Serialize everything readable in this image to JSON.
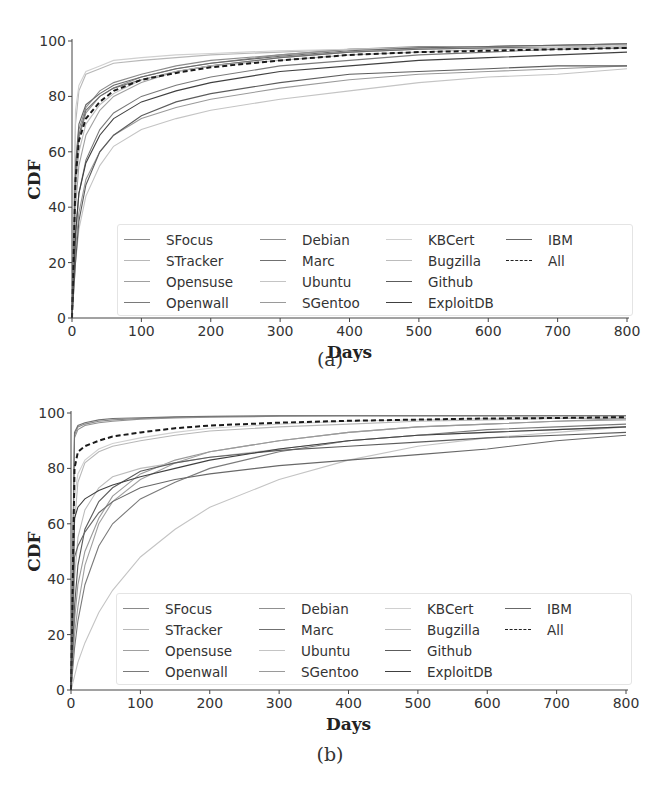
{
  "figure": {
    "panels": [
      {
        "id": "a",
        "caption": "(a)",
        "ylabel": "CDF",
        "xlabel": "Days"
      },
      {
        "id": "b",
        "caption": "(b)",
        "ylabel": "CDF",
        "xlabel": "Days"
      }
    ],
    "xticks": [
      "0",
      "100",
      "200",
      "300",
      "400",
      "500",
      "600",
      "700",
      "800"
    ],
    "yticks": [
      "0",
      "20",
      "40",
      "60",
      "80",
      "100"
    ],
    "legend": [
      {
        "label": "SFocus",
        "color": "#8a8a8a",
        "style": "solid"
      },
      {
        "label": "STracker",
        "color": "#b8b8b8",
        "style": "solid"
      },
      {
        "label": "Opensuse",
        "color": "#a0a0a0",
        "style": "solid"
      },
      {
        "label": "Openwall",
        "color": "#7a7a7a",
        "style": "solid"
      },
      {
        "label": "Debian",
        "color": "#909090",
        "style": "solid"
      },
      {
        "label": "Marc",
        "color": "#707070",
        "style": "solid"
      },
      {
        "label": "Ubuntu",
        "color": "#c4c4c4",
        "style": "solid"
      },
      {
        "label": "SGentoo",
        "color": "#9a9a9a",
        "style": "solid"
      },
      {
        "label": "KBCert",
        "color": "#d0d0d0",
        "style": "solid"
      },
      {
        "label": "Bugzilla",
        "color": "#bcbcbc",
        "style": "solid"
      },
      {
        "label": "Github",
        "color": "#5c5c5c",
        "style": "solid"
      },
      {
        "label": "ExploitDB",
        "color": "#404040",
        "style": "solid"
      },
      {
        "label": "IBM",
        "color": "#686868",
        "style": "solid"
      },
      {
        "label": "All",
        "color": "#1a1a1a",
        "style": "dashed"
      }
    ]
  },
  "chart_data": [
    {
      "type": "line",
      "title": "(a)",
      "xlabel": "Days",
      "ylabel": "CDF",
      "xlim": [
        0,
        800
      ],
      "ylim": [
        0,
        100
      ],
      "grid": false,
      "legend_position": "lower right, 4 columns",
      "x": [
        0,
        5,
        10,
        20,
        40,
        60,
        100,
        150,
        200,
        300,
        400,
        500,
        600,
        700,
        800
      ],
      "series": [
        {
          "name": "SFocus",
          "values": [
            0,
            55,
            68,
            76,
            82,
            85,
            88,
            91,
            93,
            95,
            97,
            98,
            98,
            98.5,
            99
          ]
        },
        {
          "name": "STracker",
          "values": [
            0,
            70,
            82,
            88,
            90,
            92,
            93,
            94,
            95,
            96,
            97,
            97.5,
            98,
            98,
            98.5
          ]
        },
        {
          "name": "Opensuse",
          "values": [
            0,
            40,
            55,
            66,
            75,
            80,
            85,
            89,
            91,
            94,
            96,
            97,
            97.5,
            98,
            98.5
          ]
        },
        {
          "name": "Openwall",
          "values": [
            0,
            30,
            45,
            57,
            68,
            74,
            80,
            84,
            87,
            91,
            93,
            95,
            96,
            97,
            97.5
          ]
        },
        {
          "name": "Debian",
          "values": [
            0,
            50,
            65,
            74,
            80,
            83,
            87,
            90,
            92,
            95,
            97,
            97.5,
            98,
            98.5,
            99
          ]
        },
        {
          "name": "Marc",
          "values": [
            0,
            50,
            66,
            75,
            80,
            83,
            86,
            89,
            91,
            94,
            96,
            97,
            97.5,
            98,
            98.5
          ]
        },
        {
          "name": "Ubuntu",
          "values": [
            0,
            20,
            32,
            44,
            55,
            62,
            68,
            72,
            75,
            79,
            82,
            85,
            87,
            88,
            90
          ]
        },
        {
          "name": "SGentoo",
          "values": [
            0,
            25,
            38,
            50,
            60,
            66,
            72,
            76,
            79,
            83,
            86,
            88,
            89,
            90,
            91
          ]
        },
        {
          "name": "KBCert",
          "values": [
            0,
            75,
            84,
            89,
            91,
            93,
            94,
            95,
            95.5,
            96.5,
            97,
            97.5,
            98,
            98,
            98.5
          ]
        },
        {
          "name": "Bugzilla",
          "values": [
            0,
            45,
            60,
            70,
            77,
            81,
            86,
            89,
            91,
            93,
            95,
            96,
            97,
            97.5,
            98
          ]
        },
        {
          "name": "Github",
          "values": [
            0,
            20,
            35,
            48,
            60,
            66,
            73,
            78,
            81,
            85,
            88,
            89,
            90,
            91,
            91
          ]
        },
        {
          "name": "ExploitDB",
          "values": [
            0,
            30,
            45,
            56,
            66,
            72,
            78,
            82,
            85,
            89,
            91,
            93,
            94,
            95,
            96
          ]
        },
        {
          "name": "IBM",
          "values": [
            0,
            55,
            70,
            77,
            81,
            84,
            87,
            90,
            92,
            94.5,
            96.5,
            97.5,
            98,
            98.5,
            99
          ]
        },
        {
          "name": "All",
          "values": [
            0,
            50,
            64,
            72,
            78,
            82,
            86,
            88.5,
            90.5,
            93,
            95,
            96,
            96.5,
            97,
            97.5
          ]
        }
      ]
    },
    {
      "type": "line",
      "title": "(b)",
      "xlabel": "Days",
      "ylabel": "CDF",
      "xlim": [
        0,
        800
      ],
      "ylim": [
        0,
        100
      ],
      "grid": false,
      "legend_position": "lower right, 4 columns",
      "x": [
        0,
        5,
        10,
        20,
        40,
        60,
        100,
        150,
        200,
        300,
        400,
        500,
        600,
        700,
        800
      ],
      "series": [
        {
          "name": "SFocus",
          "values": [
            0,
            92,
            95,
            96,
            97,
            97.5,
            98,
            98.5,
            98.7,
            99,
            99,
            99,
            99,
            99,
            99
          ]
        },
        {
          "name": "STracker",
          "values": [
            0,
            60,
            75,
            82,
            86,
            88,
            90,
            92,
            93.5,
            95,
            96,
            97,
            97.5,
            98,
            98
          ]
        },
        {
          "name": "Opensuse",
          "values": [
            0,
            20,
            30,
            45,
            60,
            68,
            76,
            82,
            86,
            90,
            93,
            95,
            96,
            97,
            97.5
          ]
        },
        {
          "name": "Openwall",
          "values": [
            0,
            15,
            25,
            38,
            52,
            60,
            69,
            75,
            80,
            86,
            90,
            92,
            94,
            95,
            96
          ]
        },
        {
          "name": "Debian",
          "values": [
            0,
            91,
            94,
            95.5,
            96.5,
            97,
            97.8,
            98.2,
            98.5,
            98.8,
            99,
            99,
            99,
            99,
            99
          ]
        },
        {
          "name": "Marc",
          "values": [
            0,
            93,
            95.5,
            96.5,
            97.5,
            98,
            98.3,
            98.6,
            98.8,
            99,
            99,
            99,
            99,
            99,
            99
          ]
        },
        {
          "name": "Ubuntu",
          "values": [
            0,
            5,
            10,
            17,
            28,
            36,
            48,
            58,
            66,
            76,
            83,
            88,
            91,
            93,
            95
          ]
        },
        {
          "name": "SGentoo",
          "values": [
            0,
            25,
            38,
            50,
            62,
            70,
            78,
            83,
            86,
            90,
            93,
            95,
            96,
            97,
            98
          ]
        },
        {
          "name": "KBCert",
          "values": [
            0,
            70,
            78,
            83,
            87,
            89,
            91,
            93,
            94.5,
            96,
            97,
            97.5,
            98,
            98.5,
            98.5
          ]
        },
        {
          "name": "Bugzilla",
          "values": [
            0,
            40,
            55,
            65,
            73,
            77,
            80,
            82,
            84,
            87,
            90,
            92,
            93,
            94,
            95
          ]
        },
        {
          "name": "Github",
          "values": [
            0,
            30,
            45,
            58,
            68,
            73,
            79,
            82,
            84,
            86.5,
            88,
            89.5,
            91,
            92,
            93
          ]
        },
        {
          "name": "ExploitDB",
          "values": [
            0,
            62,
            66,
            69,
            72,
            74,
            77,
            80,
            83,
            87,
            90,
            92,
            93,
            94,
            95
          ]
        },
        {
          "name": "IBM",
          "values": [
            0,
            48,
            52,
            57,
            64,
            68,
            73,
            76,
            78,
            81,
            83,
            85,
            87,
            90,
            92
          ]
        },
        {
          "name": "All",
          "values": [
            0,
            80,
            86,
            88,
            90,
            91.5,
            93,
            94.5,
            95.5,
            96.5,
            97.2,
            97.6,
            98,
            98.2,
            98.5
          ]
        }
      ]
    }
  ]
}
